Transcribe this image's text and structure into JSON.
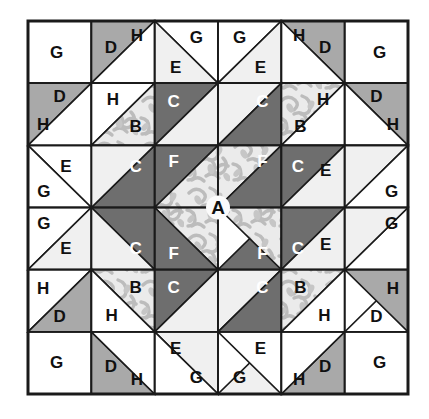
{
  "diagram": {
    "type": "quilt-block",
    "grid": {
      "rows": 6,
      "cols": 6
    },
    "canvas": {
      "width": 429,
      "height": 419
    },
    "block": {
      "x": 28,
      "y": 21,
      "width": 380,
      "height": 373
    },
    "colors": {
      "white": "#ffffff",
      "light_gray": "#f0f0f0",
      "medium_gray": "#a9a9a9",
      "dark_gray": "#6e6e6e",
      "print_base": "#e8e8e8",
      "print_motif": "#b9b9b9",
      "outline": "#1a1a1a",
      "label_dark": "#101010",
      "label_light": "#ffffff"
    },
    "legend": [
      {
        "key": "A",
        "fabric": "floral print",
        "shape": "on-point center square"
      },
      {
        "key": "B",
        "fabric": "floral print",
        "shape": "half-square triangle"
      },
      {
        "key": "C",
        "fabric": "dark gray",
        "shape": "half-square triangle"
      },
      {
        "key": "D",
        "fabric": "medium gray",
        "shape": "half-square triangle"
      },
      {
        "key": "E",
        "fabric": "light gray",
        "shape": "half-square triangle"
      },
      {
        "key": "F",
        "fabric": "dark gray",
        "shape": "quarter-square triangle"
      },
      {
        "key": "G",
        "fabric": "white",
        "shape": "square / triangle"
      },
      {
        "key": "H",
        "fabric": "white",
        "shape": "half-square triangle"
      }
    ],
    "pieces": [
      {
        "id": "r1c1-G",
        "label": "G",
        "fill": "white",
        "label_color": "dark",
        "shape": "square",
        "pts": "0,0 1,0 1,1 0,1",
        "lx": 0.45,
        "ly": 0.5,
        "cell": [
          0,
          0
        ]
      },
      {
        "id": "r1c2-D",
        "label": "D",
        "fill": "medium_gray",
        "label_color": "dark",
        "shape": "tri",
        "pts": "0,0 1,0 0,1",
        "lx": 0.31,
        "ly": 0.42,
        "cell": [
          0,
          1
        ]
      },
      {
        "id": "r1c2-H",
        "label": "H",
        "fill": "white",
        "label_color": "dark",
        "shape": "tri",
        "pts": "1,0 1,1 0,1",
        "lx": 0.72,
        "ly": 0.24,
        "cell": [
          0,
          1
        ]
      },
      {
        "id": "r1c3-G",
        "label": "G",
        "fill": "white",
        "label_color": "dark",
        "shape": "tri",
        "pts": "0,0 1,0 1,1",
        "lx": 0.66,
        "ly": 0.26,
        "cell": [
          0,
          2
        ]
      },
      {
        "id": "r1c3-E",
        "label": "E",
        "fill": "light_gray",
        "label_color": "dark",
        "shape": "tri",
        "pts": "0,0 1,1 0,1",
        "lx": 0.33,
        "ly": 0.74,
        "cell": [
          0,
          2
        ]
      },
      {
        "id": "r1c4-G",
        "label": "G",
        "fill": "white",
        "label_color": "dark",
        "shape": "tri",
        "pts": "0,0 1,0 0,1",
        "lx": 0.34,
        "ly": 0.26,
        "cell": [
          0,
          3
        ]
      },
      {
        "id": "r1c4-E",
        "label": "E",
        "fill": "light_gray",
        "label_color": "dark",
        "shape": "tri",
        "pts": "1,0 1,1 0,1",
        "lx": 0.67,
        "ly": 0.74,
        "cell": [
          0,
          3
        ]
      },
      {
        "id": "r1c5-D",
        "label": "D",
        "fill": "medium_gray",
        "label_color": "dark",
        "shape": "tri",
        "pts": "0,0 1,0 1,1",
        "lx": 0.69,
        "ly": 0.42,
        "cell": [
          0,
          4
        ]
      },
      {
        "id": "r1c5-H",
        "label": "H",
        "fill": "white",
        "label_color": "dark",
        "shape": "tri",
        "pts": "0,0 1,1 0,1",
        "lx": 0.28,
        "ly": 0.24,
        "cell": [
          0,
          4
        ]
      },
      {
        "id": "r1c6-G",
        "label": "G",
        "fill": "white",
        "label_color": "dark",
        "shape": "square",
        "pts": "0,0 1,0 1,1 0,1",
        "lx": 0.55,
        "ly": 0.5,
        "cell": [
          0,
          5
        ]
      },
      {
        "id": "r2c1-D",
        "label": "D",
        "fill": "medium_gray",
        "label_color": "dark",
        "shape": "tri",
        "pts": "0,0 1,0 0,1",
        "lx": 0.5,
        "ly": 0.22,
        "cell": [
          1,
          0
        ]
      },
      {
        "id": "r2c1-H",
        "label": "H",
        "fill": "white",
        "label_color": "dark",
        "shape": "tri",
        "pts": "1,0 1,1 0,1",
        "lx": 0.24,
        "ly": 0.66,
        "cell": [
          1,
          0
        ]
      },
      {
        "id": "r2c2-H",
        "label": "H",
        "fill": "white",
        "label_color": "dark",
        "shape": "tri",
        "pts": "0,0 1,0 0,1",
        "lx": 0.34,
        "ly": 0.26,
        "cell": [
          1,
          1
        ]
      },
      {
        "id": "r2c2-B",
        "label": "B",
        "fill": "print",
        "label_color": "dark",
        "shape": "tri",
        "pts": "1,0 1,1 0,1",
        "lx": 0.7,
        "ly": 0.7,
        "cell": [
          1,
          1
        ]
      },
      {
        "id": "r2c3-C",
        "label": "C",
        "fill": "dark_gray",
        "label_color": "light",
        "shape": "tri",
        "pts": "0,0 1,0 0,1",
        "lx": 0.3,
        "ly": 0.3,
        "cell": [
          1,
          2
        ]
      },
      {
        "id": "r2c3-E",
        "label": "",
        "fill": "light_gray",
        "label_color": "dark",
        "shape": "tri",
        "pts": "1,0 1,1 0,1",
        "lx": 0.7,
        "ly": 0.72,
        "cell": [
          1,
          2
        ]
      },
      {
        "id": "r2c4-E",
        "label": "",
        "fill": "light_gray",
        "label_color": "dark",
        "shape": "tri",
        "pts": "0,0 1,0 0,1",
        "lx": 0.3,
        "ly": 0.72,
        "cell": [
          1,
          3
        ]
      },
      {
        "id": "r2c4-C",
        "label": "C",
        "fill": "dark_gray",
        "label_color": "light",
        "shape": "tri",
        "pts": "1,0 1,1 0,1",
        "lx": 0.7,
        "ly": 0.3,
        "cell": [
          1,
          3
        ]
      },
      {
        "id": "r2c5-B",
        "label": "B",
        "fill": "print",
        "label_color": "dark",
        "shape": "tri",
        "pts": "0,0 1,0 0,1",
        "lx": 0.3,
        "ly": 0.7,
        "cell": [
          1,
          4
        ]
      },
      {
        "id": "r2c5-H",
        "label": "H",
        "fill": "white",
        "label_color": "dark",
        "shape": "tri",
        "pts": "1,0 1,1 0,1",
        "lx": 0.66,
        "ly": 0.26,
        "cell": [
          1,
          4
        ]
      },
      {
        "id": "r2c6-D",
        "label": "D",
        "fill": "medium_gray",
        "label_color": "dark",
        "shape": "tri",
        "pts": "0,0 1,0 1,1",
        "lx": 0.5,
        "ly": 0.22,
        "cell": [
          1,
          5
        ]
      },
      {
        "id": "r2c6-H",
        "label": "H",
        "fill": "white",
        "label_color": "dark",
        "shape": "tri",
        "pts": "0,0 1,1 0,1",
        "lx": 0.76,
        "ly": 0.66,
        "cell": [
          1,
          5
        ]
      },
      {
        "id": "r3c1-E",
        "label": "E",
        "fill": "light_gray",
        "label_color": "dark",
        "shape": "tri",
        "pts": "0,0 1,1 0,1",
        "lx": 0.6,
        "ly": 0.34,
        "cell": [
          2,
          0
        ]
      },
      {
        "id": "r3c1-G",
        "label": "G",
        "fill": "white",
        "label_color": "dark",
        "shape": "tri",
        "pts": "0,0 1,1 0,1",
        "lx": 0.25,
        "ly": 0.74,
        "cell": [
          2,
          0
        ],
        "variant": "lower-left"
      },
      {
        "id": "r3c2-C",
        "label": "C",
        "fill": "dark_gray",
        "label_color": "light",
        "shape": "tri",
        "pts": "1,0 1,1 0,1",
        "lx": 0.7,
        "ly": 0.34,
        "cell": [
          2,
          1
        ]
      },
      {
        "id": "r3c2-E",
        "label": "",
        "fill": "light_gray",
        "label_color": "dark",
        "shape": "tri",
        "pts": "0,0 1,0 0,1",
        "lx": 0.3,
        "ly": 0.3,
        "cell": [
          2,
          1
        ]
      },
      {
        "id": "r3c3-F",
        "label": "F",
        "fill": "dark_gray",
        "label_color": "light",
        "shape": "tri",
        "pts": "0,0 1,0 0,1",
        "lx": 0.3,
        "ly": 0.26,
        "cell": [
          2,
          2
        ]
      },
      {
        "id": "r3c3-A1",
        "label": "",
        "fill": "print",
        "label_color": "dark",
        "shape": "tri",
        "pts": "1,0 1,1 0,1",
        "lx": 0.7,
        "ly": 0.7,
        "cell": [
          2,
          2
        ]
      },
      {
        "id": "r3c4-A2",
        "label": "",
        "fill": "print",
        "label_color": "dark",
        "shape": "tri",
        "pts": "0,0 1,0 0,1",
        "lx": 0.3,
        "ly": 0.7,
        "cell": [
          2,
          3
        ]
      },
      {
        "id": "r3c4-F",
        "label": "F",
        "fill": "dark_gray",
        "label_color": "light",
        "shape": "tri",
        "pts": "1,0 1,1 0,1",
        "lx": 0.7,
        "ly": 0.26,
        "cell": [
          2,
          3
        ]
      },
      {
        "id": "r3c5-C",
        "label": "C",
        "fill": "dark_gray",
        "label_color": "light",
        "shape": "tri",
        "pts": "0,0 1,0 0,1",
        "lx": 0.26,
        "ly": 0.34,
        "cell": [
          2,
          4
        ]
      },
      {
        "id": "r3c5-E",
        "label": "E",
        "fill": "light_gray",
        "label_color": "dark",
        "shape": "tri",
        "pts": "1,0 1,1 0,1",
        "lx": 0.7,
        "ly": 0.4,
        "cell": [
          2,
          4
        ]
      },
      {
        "id": "r3c6-E",
        "label": "",
        "fill": "light_gray",
        "label_color": "dark",
        "shape": "tri",
        "pts": "0,0 1,0 0,1",
        "lx": 0.3,
        "ly": 0.3,
        "cell": [
          2,
          5
        ]
      },
      {
        "id": "r3c6-G",
        "label": "G",
        "fill": "white",
        "label_color": "dark",
        "shape": "tri",
        "pts": "1,0 1,1 0,1",
        "lx": 0.74,
        "ly": 0.74,
        "cell": [
          2,
          5
        ]
      },
      {
        "id": "r4c1-G",
        "label": "G",
        "fill": "white",
        "label_color": "dark",
        "shape": "tri",
        "pts": "0,0 1,0 0,1",
        "lx": 0.25,
        "ly": 0.26,
        "cell": [
          3,
          0
        ]
      },
      {
        "id": "r4c1-E",
        "label": "E",
        "fill": "light_gray",
        "label_color": "dark",
        "shape": "tri",
        "pts": "1,0 1,1 0,1",
        "lx": 0.6,
        "ly": 0.66,
        "cell": [
          3,
          0
        ]
      },
      {
        "id": "r4c2-C",
        "label": "C",
        "fill": "dark_gray",
        "label_color": "light",
        "shape": "tri",
        "pts": "0,0 1,0 1,1",
        "lx": 0.7,
        "ly": 0.66,
        "cell": [
          3,
          1
        ]
      },
      {
        "id": "r4c2-E",
        "label": "",
        "fill": "light_gray",
        "label_color": "dark",
        "shape": "tri",
        "pts": "0,0 1,1 0,1",
        "lx": 0.3,
        "ly": 0.7,
        "cell": [
          3,
          1
        ]
      },
      {
        "id": "r4c3-A3",
        "label": "",
        "fill": "print",
        "label_color": "dark",
        "shape": "tri",
        "pts": "0,0 1,0 1,1",
        "lx": 0.7,
        "ly": 0.3,
        "cell": [
          3,
          2
        ]
      },
      {
        "id": "r4c3-F",
        "label": "F",
        "fill": "dark_gray",
        "label_color": "light",
        "shape": "tri",
        "pts": "0,0 1,1 0,1",
        "lx": 0.3,
        "ly": 0.74,
        "cell": [
          3,
          2
        ]
      },
      {
        "id": "r4c4-F",
        "label": "F",
        "fill": "dark_gray",
        "label_color": "light",
        "shape": "tri",
        "pts": "1,0 1,1 0,1",
        "lx": 0.7,
        "ly": 0.74,
        "cell": [
          3,
          3
        ]
      },
      {
        "id": "r4c4-A4",
        "label": "",
        "fill": "print",
        "label_color": "dark",
        "shape": "tri",
        "pts": "0,0 1,0 1,1",
        "lx": 0.3,
        "ly": 0.3,
        "cell": [
          3,
          3
        ],
        "variant": "upper-left"
      },
      {
        "id": "r4c5-C",
        "label": "C",
        "fill": "dark_gray",
        "label_color": "light",
        "shape": "tri",
        "pts": "0,0 1,0 0,1",
        "lx": 0.26,
        "ly": 0.66,
        "cell": [
          3,
          4
        ]
      },
      {
        "id": "r4c5-E",
        "label": "E",
        "fill": "light_gray",
        "label_color": "dark",
        "shape": "tri",
        "pts": "1,0 1,1 0,1",
        "lx": 0.7,
        "ly": 0.6,
        "cell": [
          3,
          4
        ]
      },
      {
        "id": "r4c6-G",
        "label": "G",
        "fill": "white",
        "label_color": "dark",
        "shape": "tri",
        "pts": "1,0 1,1 0,1",
        "lx": 0.74,
        "ly": 0.26,
        "cell": [
          3,
          5
        ]
      },
      {
        "id": "r4c6-E",
        "label": "",
        "fill": "light_gray",
        "label_color": "dark",
        "shape": "tri",
        "pts": "0,0 1,0 0,1",
        "lx": 0.3,
        "ly": 0.7,
        "cell": [
          3,
          5
        ]
      },
      {
        "id": "r5c1-H",
        "label": "H",
        "fill": "white",
        "label_color": "dark",
        "shape": "tri",
        "pts": "0,0 1,0 0,1",
        "lx": 0.24,
        "ly": 0.3,
        "cell": [
          4,
          0
        ]
      },
      {
        "id": "r5c1-D",
        "label": "D",
        "fill": "medium_gray",
        "label_color": "dark",
        "shape": "tri",
        "pts": "1,0 1,1 0,1",
        "lx": 0.5,
        "ly": 0.76,
        "cell": [
          4,
          0
        ]
      },
      {
        "id": "r5c2-B",
        "label": "B",
        "fill": "print",
        "label_color": "dark",
        "shape": "tri",
        "pts": "0,0 1,0 1,1",
        "lx": 0.7,
        "ly": 0.28,
        "cell": [
          4,
          1
        ]
      },
      {
        "id": "r5c2-H",
        "label": "H",
        "fill": "white",
        "label_color": "dark",
        "shape": "tri",
        "pts": "0,0 1,1 0,1",
        "lx": 0.32,
        "ly": 0.74,
        "cell": [
          4,
          1
        ]
      },
      {
        "id": "r5c3-C",
        "label": "C",
        "fill": "dark_gray",
        "label_color": "light",
        "shape": "tri",
        "pts": "0,0 1,0 0,1",
        "lx": 0.3,
        "ly": 0.28,
        "cell": [
          4,
          2
        ]
      },
      {
        "id": "r5c3-E",
        "label": "",
        "fill": "light_gray",
        "label_color": "dark",
        "shape": "tri",
        "pts": "1,0 1,1 0,1",
        "lx": 0.7,
        "ly": 0.72,
        "cell": [
          4,
          2
        ]
      },
      {
        "id": "r5c4-E",
        "label": "",
        "fill": "light_gray",
        "label_color": "dark",
        "shape": "tri",
        "pts": "0,0 1,0 0,1",
        "lx": 0.3,
        "ly": 0.72,
        "cell": [
          4,
          3
        ]
      },
      {
        "id": "r5c4-C",
        "label": "C",
        "fill": "dark_gray",
        "label_color": "light",
        "shape": "tri",
        "pts": "1,0 1,1 0,1",
        "lx": 0.7,
        "ly": 0.28,
        "cell": [
          4,
          3
        ]
      },
      {
        "id": "r5c5-B",
        "label": "B",
        "fill": "print",
        "label_color": "dark",
        "shape": "tri",
        "pts": "0,0 1,0 0,1",
        "lx": 0.3,
        "ly": 0.28,
        "cell": [
          4,
          4
        ]
      },
      {
        "id": "r5c5-H",
        "label": "H",
        "fill": "white",
        "label_color": "dark",
        "shape": "tri",
        "pts": "1,0 1,1 0,1",
        "lx": 0.68,
        "ly": 0.74,
        "cell": [
          4,
          4
        ]
      },
      {
        "id": "r5c6-H",
        "label": "H",
        "fill": "white",
        "label_color": "dark",
        "shape": "tri",
        "pts": "1,0 1,1 0,1",
        "lx": 0.76,
        "ly": 0.3,
        "cell": [
          4,
          5
        ]
      },
      {
        "id": "r5c6-D",
        "label": "D",
        "fill": "medium_gray",
        "label_color": "dark",
        "shape": "tri",
        "pts": "0,0 1,0 1,1",
        "lx": 0.5,
        "ly": 0.76,
        "cell": [
          4,
          5
        ]
      },
      {
        "id": "r6c1-G",
        "label": "G",
        "fill": "white",
        "label_color": "dark",
        "shape": "square",
        "pts": "0,0 1,0 1,1 0,1",
        "lx": 0.45,
        "ly": 0.5,
        "cell": [
          5,
          0
        ]
      },
      {
        "id": "r6c2-D",
        "label": "D",
        "fill": "medium_gray",
        "label_color": "dark",
        "shape": "tri",
        "pts": "0,0 1,1 0,1",
        "lx": 0.31,
        "ly": 0.56,
        "cell": [
          5,
          1
        ]
      },
      {
        "id": "r6c2-H",
        "label": "H",
        "fill": "white",
        "label_color": "dark",
        "shape": "tri",
        "pts": "0,0 1,0 1,1",
        "lx": 0.72,
        "ly": 0.76,
        "cell": [
          5,
          1
        ]
      },
      {
        "id": "r6c3-E",
        "label": "E",
        "fill": "light_gray",
        "label_color": "dark",
        "shape": "tri",
        "pts": "0,0 1,0 1,1",
        "lx": 0.33,
        "ly": 0.26,
        "cell": [
          5,
          2
        ]
      },
      {
        "id": "r6c3-G",
        "label": "G",
        "fill": "white",
        "label_color": "dark",
        "shape": "tri",
        "pts": "0,0 1,1 0,1",
        "lx": 0.66,
        "ly": 0.74,
        "cell": [
          5,
          2
        ]
      },
      {
        "id": "r6c4-E",
        "label": "E",
        "fill": "light_gray",
        "label_color": "dark",
        "shape": "tri",
        "pts": "1,0 1,1 0,1",
        "lx": 0.67,
        "ly": 0.26,
        "cell": [
          5,
          3
        ]
      },
      {
        "id": "r6c4-G",
        "label": "G",
        "fill": "white",
        "label_color": "dark",
        "shape": "tri",
        "pts": "0,0 1,0 1,1",
        "lx": 0.34,
        "ly": 0.74,
        "cell": [
          5,
          3
        ]
      },
      {
        "id": "r6c5-D",
        "label": "D",
        "fill": "medium_gray",
        "label_color": "dark",
        "shape": "tri",
        "pts": "1,0 1,1 0,1",
        "lx": 0.69,
        "ly": 0.56,
        "cell": [
          5,
          4
        ]
      },
      {
        "id": "r6c5-H",
        "label": "H",
        "fill": "white",
        "label_color": "dark",
        "shape": "tri",
        "pts": "0,0 1,0 0,1",
        "lx": 0.28,
        "ly": 0.76,
        "cell": [
          5,
          4
        ]
      },
      {
        "id": "r6c6-G",
        "label": "G",
        "fill": "white",
        "label_color": "dark",
        "shape": "square",
        "pts": "0,0 1,0 1,1 0,1",
        "lx": 0.55,
        "ly": 0.5,
        "cell": [
          5,
          5
        ]
      }
    ],
    "center_label": {
      "text": "A",
      "cx": 0.5,
      "cy": 0.5
    }
  }
}
